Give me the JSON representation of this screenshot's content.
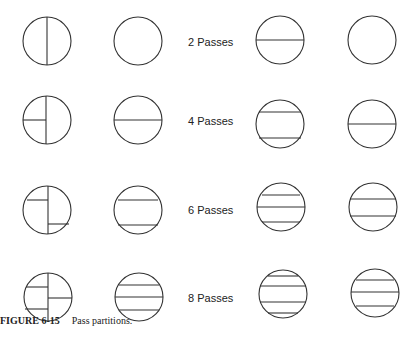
{
  "figure": {
    "caption_number": "FIGURE 6-15",
    "caption_text": "Pass partitions."
  },
  "rows": [
    {
      "label": "2 Passes"
    },
    {
      "label": "4 Passes"
    },
    {
      "label": "6 Passes"
    },
    {
      "label": "8 Passes"
    }
  ],
  "colors": {
    "stroke": "#333333",
    "background": "#ffffff"
  }
}
